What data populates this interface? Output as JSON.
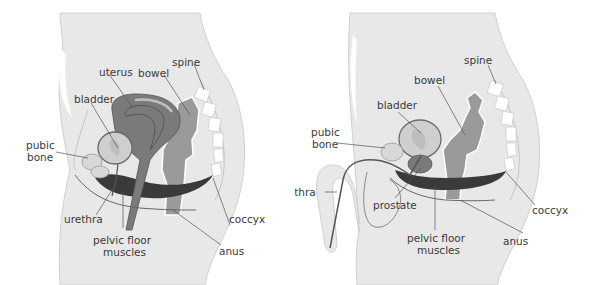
{
  "colors": {
    "body": "#e8e8e8",
    "body_outline": "#c4c4c4",
    "organ_dark": "#7a7a7a",
    "organ_mid": "#9a9a9a",
    "bladder_fill": "#cfcfcf",
    "muscle": "#3a3a3a",
    "spine": "#ffffff",
    "line": "#555555",
    "text": "#3a3a3a"
  },
  "female": {
    "labels": {
      "uterus": "uterus",
      "bowel": "bowel",
      "spine": "spine",
      "bladder": "bladder",
      "pubic_bone_1": "pubic",
      "pubic_bone_2": "bone",
      "urethra": "urethra",
      "pelvic_floor_1": "pelvic floor",
      "pelvic_floor_2": "muscles",
      "coccyx": "coccyx",
      "anus": "anus"
    }
  },
  "male": {
    "labels": {
      "spine": "spine",
      "bowel": "bowel",
      "bladder": "bladder",
      "pubic_bone_1": "pubic",
      "pubic_bone_2": "bone",
      "urethra": "urethra",
      "prostate": "prostate",
      "pelvic_floor_1": "pelvic floor",
      "pelvic_floor_2": "muscles",
      "coccyx": "coccyx",
      "anus": "anus"
    }
  }
}
